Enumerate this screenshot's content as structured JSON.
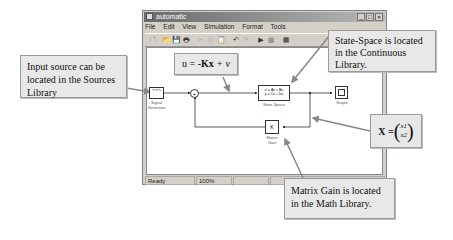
{
  "window": {
    "title": "automatic",
    "controls": {
      "minimize": "_",
      "maximize": "□",
      "close": "×"
    },
    "menu": [
      "File",
      "Edit",
      "View",
      "Simulation",
      "Format",
      "Tools"
    ],
    "toolbar_icons": [
      "new-file-icon",
      "open-icon",
      "save-icon",
      "print-icon",
      "cut-icon",
      "copy-icon",
      "paste-icon",
      "undo-icon",
      "redo-icon",
      "run-icon",
      "stop-icon",
      "library-browser-icon"
    ],
    "toolbar_glyphs": [
      "🗋",
      "📂",
      "💾",
      "🖶",
      "✂",
      "⎘",
      "📋",
      "↶",
      "↷",
      "▶",
      "■",
      "▦"
    ],
    "status": {
      "ready": "Ready",
      "zoom": "100%",
      "empty1": "",
      "empty2": ""
    }
  },
  "blocks": {
    "signal_generator": {
      "label_line1": "Signal",
      "label_line2": "Generator",
      "glyph": "∿∿∿"
    },
    "sum": {
      "glyph": "+",
      "signs": "+ -"
    },
    "state_space": {
      "eq1": "x' = Ax + Bu",
      "eq2": "y = Cx + Du",
      "label": "State-Space"
    },
    "scope": {
      "label": "Scope"
    },
    "matrix_gain": {
      "glyph": "K",
      "label_line1": "Matrix",
      "label_line2": "Gain"
    }
  },
  "callouts": {
    "input_source": "Input source can be located in the Sources Library",
    "control_law_u": "u = ",
    "control_law_k": "-Kx",
    "control_law_v": " + v",
    "state_space": "State-Space is located in the Continuous Library.",
    "state_vector_x": "X = ",
    "state_vector_x1": "x1",
    "state_vector_x2": "x2",
    "matrix_gain": "Matrix Gain is located in the Math Library."
  }
}
